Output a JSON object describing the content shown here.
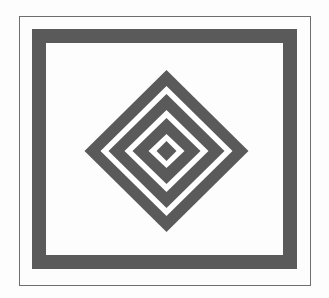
{
  "figure": {
    "canvas": {
      "width": 329,
      "height": 298,
      "background_color": "#fdfdfd"
    },
    "colors": {
      "ink_gray": "#5a5a5a",
      "rule_gray": "#6e6e6e",
      "paper_white": "#ffffff"
    },
    "outer_rule": {
      "label": "outer thin rectangle rule",
      "x": 19,
      "y": 16,
      "width": 292,
      "height": 270,
      "stroke_width": 1,
      "color": "#6e6e6e"
    },
    "band_frame": {
      "label": "thick gray rectangular band",
      "x": 32,
      "y": 29,
      "width": 265,
      "height": 240,
      "band_width": 14,
      "color": "#5a5a5a"
    },
    "diamond": {
      "label": "concentric diamond, alternating gray and white bands",
      "center_x": 166.5,
      "center_y": 151,
      "half_width": 82,
      "half_height": 81,
      "ring_count": 3,
      "gray_band_px": 16,
      "white_band_px": 8,
      "core_filled": true,
      "color": "#5a5a5a",
      "rings": [
        {
          "name": "ring-1-outer-gray",
          "half_width": 82,
          "half_height": 81,
          "fill": "#5a5a5a"
        },
        {
          "name": "gap-1-white",
          "half_width": 66,
          "half_height": 65,
          "fill": "#ffffff"
        },
        {
          "name": "ring-2-gray",
          "half_width": 58,
          "half_height": 57,
          "fill": "#5a5a5a"
        },
        {
          "name": "gap-2-white",
          "half_width": 42,
          "half_height": 41,
          "fill": "#ffffff"
        },
        {
          "name": "ring-3-gray",
          "half_width": 34,
          "half_height": 33,
          "fill": "#5a5a5a"
        },
        {
          "name": "gap-3-white",
          "half_width": 18,
          "half_height": 17,
          "fill": "#ffffff"
        },
        {
          "name": "core-gray",
          "half_width": 10,
          "half_height": 10,
          "fill": "#5a5a5a"
        }
      ]
    }
  }
}
